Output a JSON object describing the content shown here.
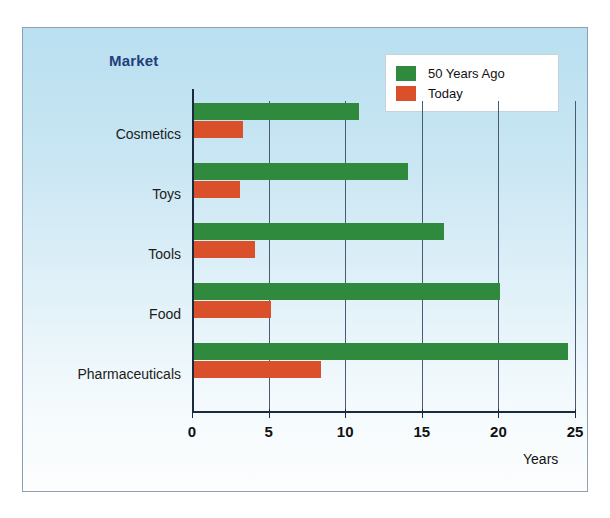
{
  "chart_data": {
    "type": "bar",
    "orientation": "horizontal",
    "title": "Market",
    "xlabel": "Years",
    "ylabel": "",
    "categories": [
      "Cosmetics",
      "Toys",
      "Tools",
      "Food",
      "Pharmaceuticals"
    ],
    "series": [
      {
        "name": "50 Years Ago",
        "color": "#2f8a3e",
        "values": [
          10.8,
          14.0,
          16.3,
          20.0,
          24.4
        ]
      },
      {
        "name": "Today",
        "color": "#da502b",
        "values": [
          3.2,
          3.0,
          4.0,
          5.0,
          8.3
        ]
      }
    ],
    "xlim": [
      0,
      25
    ],
    "xticks": [
      0,
      5,
      10,
      15,
      20,
      25
    ],
    "xtick_labels": [
      "0",
      "5",
      "10",
      "15",
      "20",
      "25"
    ],
    "grid": true,
    "grid_axis": "x",
    "legend_position": "top-right",
    "legend_entries": [
      "50 Years Ago",
      "Today"
    ]
  },
  "style": {
    "background_top": "#b9dff0",
    "background_bottom": "#fdfefe",
    "title_color": "#1f3f7a",
    "axis_color": "#1b2a3d",
    "grid_color": "#4a5a72",
    "frame_border": "#8f9fb3"
  }
}
